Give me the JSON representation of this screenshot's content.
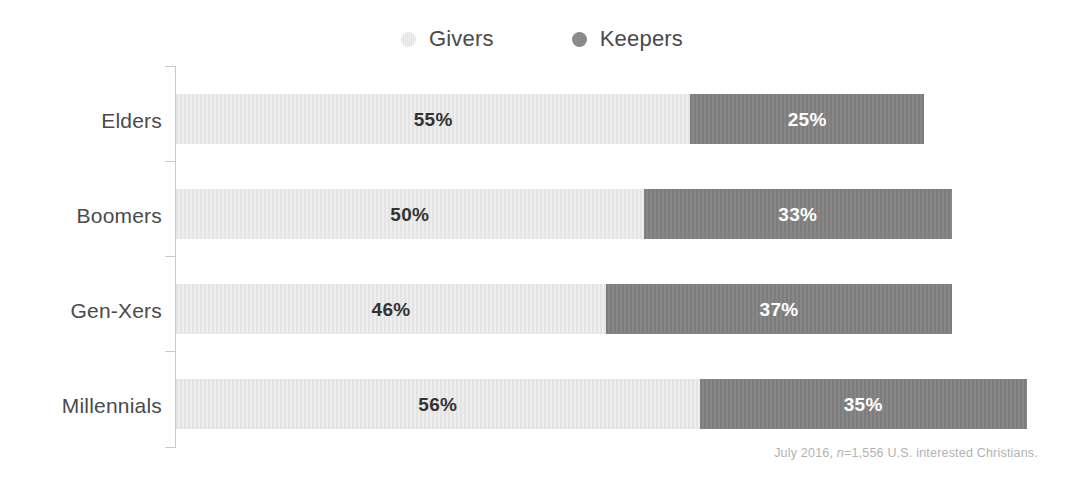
{
  "legend": {
    "items": [
      {
        "label": "Givers",
        "icon": "circle-icon",
        "color": "#e8e8e8"
      },
      {
        "label": "Keepers",
        "icon": "circle-icon",
        "color": "#808080"
      }
    ]
  },
  "footnote": {
    "prefix": "July 2016, ",
    "italic": "n",
    "suffix": "=1,556 U.S. interested Christians.",
    "full": "July 2016, n=1,556 U.S. interested Christians."
  },
  "chart_data": {
    "type": "bar",
    "orientation": "horizontal",
    "stacked": true,
    "title": "",
    "subtitle": "",
    "xlabel": "",
    "ylabel": "",
    "xlim": [
      0,
      100
    ],
    "grid": false,
    "legend_position": "top-center",
    "categories": [
      "Elders",
      "Boomers",
      "Gen-Xers",
      "Millennials"
    ],
    "series": [
      {
        "name": "Givers",
        "color": "#e8e8e8",
        "values": [
          55,
          50,
          46,
          56
        ],
        "labels": [
          "55%",
          "50%",
          "46%",
          "56%"
        ]
      },
      {
        "name": "Keepers",
        "color": "#808080",
        "values": [
          25,
          33,
          37,
          35
        ],
        "labels": [
          "25%",
          "33%",
          "37%",
          "35%"
        ]
      }
    ],
    "rows": [
      {
        "category": "Elders",
        "givers_value": 55,
        "givers_label": "55%",
        "keepers_value": 25,
        "keepers_label": "25%"
      },
      {
        "category": "Boomers",
        "givers_value": 50,
        "givers_label": "50%",
        "keepers_value": 33,
        "keepers_label": "33%"
      },
      {
        "category": "Gen-Xers",
        "givers_value": 46,
        "givers_label": "46%",
        "keepers_value": 37,
        "keepers_label": "37%"
      },
      {
        "category": "Millennials",
        "givers_value": 56,
        "givers_label": "56%",
        "keepers_value": 35,
        "keepers_label": "35%"
      }
    ]
  }
}
